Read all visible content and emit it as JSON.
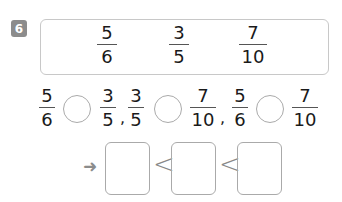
{
  "problem": {
    "number": "6",
    "given_fractions": [
      {
        "numerator": "5",
        "denominator": "6"
      },
      {
        "numerator": "3",
        "denominator": "5"
      },
      {
        "numerator": "7",
        "denominator": "10"
      }
    ],
    "comparisons": [
      {
        "left": {
          "numerator": "5",
          "denominator": "6"
        },
        "right": {
          "numerator": "3",
          "denominator": "5"
        },
        "answer": ""
      },
      {
        "left": {
          "numerator": "3",
          "denominator": "5"
        },
        "right": {
          "numerator": "7",
          "denominator": "10"
        },
        "answer": ""
      },
      {
        "left": {
          "numerator": "5",
          "denominator": "6"
        },
        "right": {
          "numerator": "7",
          "denominator": "10"
        },
        "answer": ""
      }
    ],
    "separator": ",",
    "ordering": {
      "arrow_icon": "right-arrow-icon",
      "symbol": "<",
      "slots": [
        "",
        "",
        ""
      ]
    }
  },
  "colors": {
    "badge": "#8c8c8c",
    "border": "#c8c8c8",
    "text": "#1a1a1a"
  }
}
